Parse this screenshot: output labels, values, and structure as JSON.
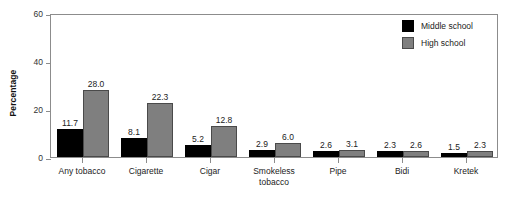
{
  "chart_data": {
    "type": "bar",
    "title": "",
    "subtitle": "",
    "xlabel": "",
    "ylabel": "Percentage",
    "ylim": [
      0,
      60
    ],
    "yticks": [
      0,
      20,
      40,
      60
    ],
    "ytick_labels": [
      "0",
      "20",
      "40",
      "60"
    ],
    "grid": false,
    "legend_position": "top-right",
    "categories": [
      "Any tobacco",
      "Cigarette",
      "Cigar",
      "Smokeless\ntobacco",
      "Pipe",
      "Bidi",
      "Kretek"
    ],
    "series": [
      {
        "name": "Middle school",
        "color": "#000000",
        "values": [
          11.7,
          8.1,
          5.2,
          2.9,
          2.6,
          2.3,
          1.5
        ],
        "value_labels": [
          "11.7",
          "8.1",
          "5.2",
          "2.9",
          "2.6",
          "2.3",
          "1.5"
        ]
      },
      {
        "name": "High school",
        "color": "#7f7f7f",
        "values": [
          28.0,
          22.3,
          12.8,
          6.0,
          3.1,
          2.6,
          2.3
        ],
        "value_labels": [
          "28.0",
          "22.3",
          "12.8",
          "6.0",
          "3.1",
          "2.6",
          "2.3"
        ]
      }
    ]
  },
  "legend": {
    "items": [
      {
        "label": "Middle school",
        "color": "#000000"
      },
      {
        "label": "High school",
        "color": "#7f7f7f"
      }
    ]
  },
  "axis": {
    "y_title": "Percentage"
  }
}
